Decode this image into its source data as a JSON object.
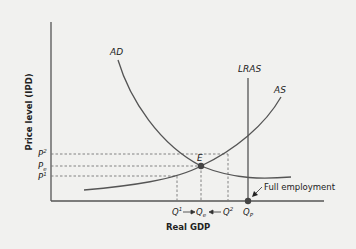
{
  "diagram": {
    "type": "AD-AS macroeconomic diagram",
    "y_axis_label": "Price level (IPD)",
    "x_axis_label": "Real GDP",
    "curves": {
      "ad": "AD",
      "as": "AS",
      "lras": "LRAS"
    },
    "equilibrium_label": "E",
    "price_labels": {
      "p2_base": "P",
      "p2_sup": "2",
      "pe_base": "P",
      "pe_sub": "e",
      "p1_base": "P",
      "p1_sup": "1"
    },
    "quantity_labels": {
      "q1_base": "Q",
      "q1_sup": "1",
      "qe_base": "Q",
      "qe_sub": "e",
      "q2_base": "Q",
      "q2_sup": "2",
      "qp_base": "Q",
      "qp_sub": "P"
    },
    "annotation": "Full employment",
    "colors": {
      "background": "#f1f1ef",
      "axis": "#555555",
      "curve": "#555555",
      "dash": "#777777",
      "point": "#444444"
    }
  }
}
